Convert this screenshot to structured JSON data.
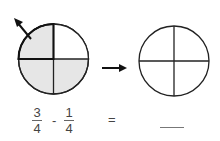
{
  "diagram": {
    "left_circle": {
      "parts": 4,
      "shaded_parts": 3,
      "removed_part": "top-left",
      "shade_color": "#e6e6e6"
    },
    "right_circle": {
      "parts": 4,
      "shaded_parts": 0
    },
    "arrow_label": "right-arrow"
  },
  "equation": {
    "term1": {
      "numerator": "3",
      "denominator": "4"
    },
    "operator": "-",
    "term2": {
      "numerator": "1",
      "denominator": "4"
    },
    "equals": "=",
    "answer_blank": ""
  }
}
